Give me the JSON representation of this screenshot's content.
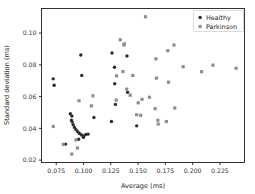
{
  "chart_data": {
    "type": "scatter",
    "title": "",
    "xlabel": "Average (ms)",
    "ylabel": "Standard deviation (ms)",
    "xlim": [
      0.0615,
      0.2475
    ],
    "ylim": [
      0.0185,
      0.1155
    ],
    "xticks": [
      0.075,
      0.1,
      0.125,
      0.15,
      0.175,
      0.2,
      0.225
    ],
    "xticklabels": [
      "0.075",
      "0.100",
      "0.125",
      "0.150",
      "0.175",
      "0.200",
      "0.225"
    ],
    "yticks": [
      0.02,
      0.04,
      0.06,
      0.08,
      0.1
    ],
    "yticklabels": [
      "0.02",
      "0.04",
      "0.06",
      "0.08",
      "0.10"
    ],
    "grid": false,
    "legend_position": "upper right",
    "legend_entries": [
      "Healthy",
      "Parkinson"
    ],
    "series": [
      {
        "name": "Healthy",
        "color": "#2b2b2b",
        "marker": "circle",
        "points": [
          [
            0.0722,
            0.0712
          ],
          [
            0.0731,
            0.0672
          ],
          [
            0.0879,
            0.0492
          ],
          [
            0.0893,
            0.0478
          ],
          [
            0.0889,
            0.0452
          ],
          [
            0.0896,
            0.0441
          ],
          [
            0.0905,
            0.0423
          ],
          [
            0.0917,
            0.0406
          ],
          [
            0.0931,
            0.0392
          ],
          [
            0.0947,
            0.0379
          ],
          [
            0.0963,
            0.0368
          ],
          [
            0.0982,
            0.0358
          ],
          [
            0.1004,
            0.0352
          ],
          [
            0.1022,
            0.0362
          ],
          [
            0.1042,
            0.0364
          ],
          [
            0.0955,
            0.0331
          ],
          [
            0.0999,
            0.0343
          ],
          [
            0.0836,
            0.0301
          ],
          [
            0.1095,
            0.0468
          ],
          [
            0.1256,
            0.0443
          ],
          [
            0.1261,
            0.0875
          ],
          [
            0.1284,
            0.0785
          ],
          [
            0.1286,
            0.0681
          ],
          [
            0.1292,
            0.0551
          ],
          [
            0.1398,
            0.0856
          ],
          [
            0.1404,
            0.0627
          ],
          [
            0.1487,
            0.0416
          ],
          [
            0.0984,
            0.0733
          ],
          [
            0.0975,
            0.0862
          ]
        ]
      },
      {
        "name": "Parkinson",
        "color": "#8e8e8e",
        "marker": "square",
        "points": [
          [
            0.0723,
            0.0412
          ],
          [
            0.0815,
            0.0299
          ],
          [
            0.0892,
            0.0238
          ],
          [
            0.0944,
            0.0276
          ],
          [
            0.0931,
            0.0327
          ],
          [
            0.0959,
            0.0574
          ],
          [
            0.1086,
            0.0605
          ],
          [
            0.1072,
            0.0542
          ],
          [
            0.1299,
            0.0578
          ],
          [
            0.1303,
            0.0731
          ],
          [
            0.1336,
            0.0958
          ],
          [
            0.1369,
            0.0925
          ],
          [
            0.1374,
            0.0932
          ],
          [
            0.1361,
            0.0758
          ],
          [
            0.1396,
            0.0647
          ],
          [
            0.1428,
            0.0609
          ],
          [
            0.1452,
            0.0733
          ],
          [
            0.1487,
            0.0486
          ],
          [
            0.1501,
            0.0561
          ],
          [
            0.1524,
            0.0482
          ],
          [
            0.1536,
            0.0583
          ],
          [
            0.1568,
            0.1103
          ],
          [
            0.1604,
            0.0596
          ],
          [
            0.1656,
            0.0524
          ],
          [
            0.1663,
            0.0838
          ],
          [
            0.1668,
            0.0716
          ],
          [
            0.1681,
            0.0451
          ],
          [
            0.1684,
            0.0427
          ],
          [
            0.1759,
            0.0443
          ],
          [
            0.1772,
            0.0889
          ],
          [
            0.1779,
            0.0691
          ],
          [
            0.1829,
            0.0925
          ],
          [
            0.1836,
            0.0528
          ],
          [
            0.1913,
            0.0788
          ],
          [
            0.2082,
            0.0757
          ],
          [
            0.2186,
            0.0798
          ],
          [
            0.2398,
            0.0779
          ]
        ]
      }
    ]
  }
}
